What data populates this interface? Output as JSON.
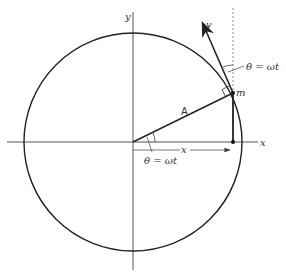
{
  "diagram": {
    "labels": {
      "y_axis": "y",
      "x_axis": "x",
      "velocity": "v",
      "mass": "m",
      "radius": "A",
      "displacement": "x",
      "angle_center": "θ = ωt",
      "angle_tangent": "θ = ωt"
    },
    "colors": {
      "stroke": "#222222",
      "axis": "#555555",
      "dotted": "#888888",
      "background": "#ffffff"
    },
    "geometry": {
      "center": [
        133,
        142
      ],
      "radius": 109,
      "point_m": [
        233,
        93
      ],
      "foot": [
        233,
        143
      ],
      "velocity_tip": [
        203,
        22
      ]
    }
  }
}
